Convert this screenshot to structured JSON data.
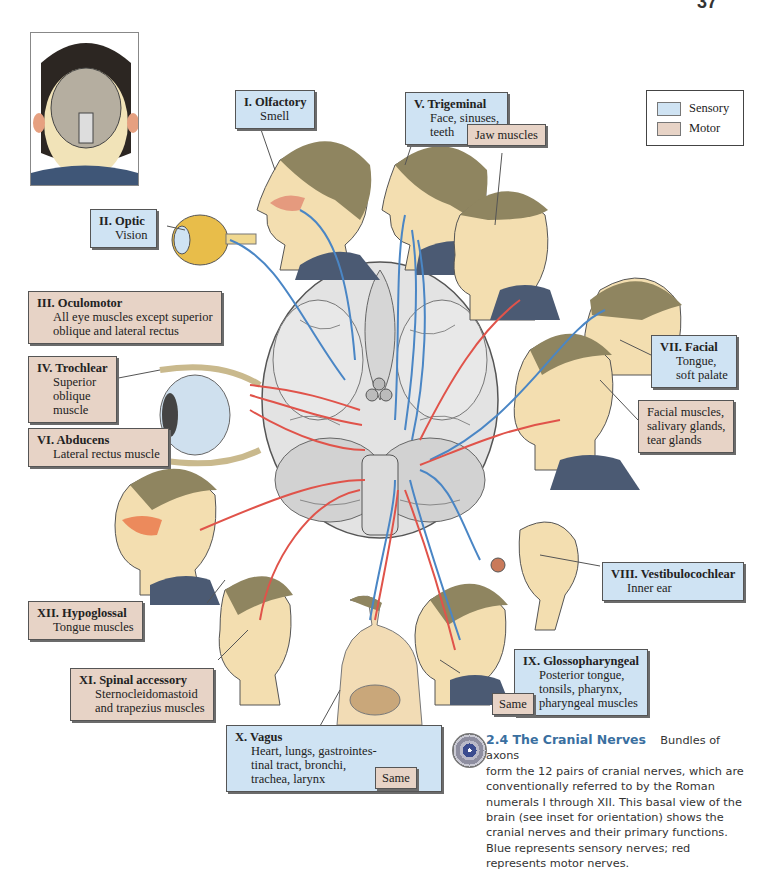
{
  "page": {
    "number": "37"
  },
  "legend": {
    "items": [
      {
        "label": "Sensory",
        "color": "#cfe3f3"
      },
      {
        "label": "Motor",
        "color": "#e7d3c6"
      }
    ]
  },
  "colors": {
    "sensory_nerve": "#4a86c5",
    "motor_nerve": "#e0534a",
    "sensory_box": "#cfe3f3",
    "motor_box": "#e7d3c6",
    "caption_title": "#3a6fa0"
  },
  "inset": {
    "description": "Basal view of brain inside inverted head (orientation inset)"
  },
  "nerves": [
    {
      "id": "I",
      "title": "I. Olfactory",
      "function": "Smell",
      "type": "sensory"
    },
    {
      "id": "II",
      "title": "II. Optic",
      "function": "Vision",
      "type": "sensory"
    },
    {
      "id": "III",
      "title": "III. Oculomotor",
      "function_lines": [
        "All eye muscles except superior",
        "oblique and lateral rectus"
      ],
      "type": "motor"
    },
    {
      "id": "IV",
      "title": "IV. Trochlear",
      "function_lines": [
        "Superior",
        "oblique",
        "muscle"
      ],
      "type": "motor"
    },
    {
      "id": "V",
      "title": "V. Trigeminal",
      "function_lines": [
        "Face, sinuses,",
        "teeth"
      ],
      "type": "sensory",
      "motor_label": "Jaw muscles"
    },
    {
      "id": "VI",
      "title": "VI. Abducens",
      "function": "Lateral rectus muscle",
      "type": "motor"
    },
    {
      "id": "VII",
      "title": "VII. Facial",
      "function_lines": [
        "Tongue,",
        "soft palate"
      ],
      "type": "sensory",
      "motor_lines": [
        "Facial muscles,",
        "salivary glands,",
        "tear glands"
      ]
    },
    {
      "id": "VIII",
      "title": "VIII. Vestibulocochlear",
      "function": "Inner ear",
      "type": "sensory"
    },
    {
      "id": "IX",
      "title": "IX. Glossopharyngeal",
      "function_lines": [
        "Posterior tongue,",
        "tonsils, pharynx,",
        "pharyngeal muscles"
      ],
      "type": "sensory",
      "motor_label": "Same"
    },
    {
      "id": "X",
      "title": "X. Vagus",
      "function_lines": [
        "Heart, lungs, gastrointes-",
        "tinal tract, bronchi,",
        "trachea, larynx"
      ],
      "type": "sensory",
      "motor_label": "Same"
    },
    {
      "id": "XI",
      "title": "XI. Spinal accessory",
      "function_lines": [
        "Sternocleidomastoid",
        "and trapezius muscles"
      ],
      "type": "motor"
    },
    {
      "id": "XII",
      "title": "XII. Hypoglossal",
      "function": "Tongue muscles",
      "type": "motor"
    }
  ],
  "caption": {
    "title": "2.4  The Cranial Nerves",
    "text_first": "Bundles of axons",
    "text_rest": "form the 12 pairs of cranial nerves, which are conventionally referred to by the Roman numerals I through XII. This basal view of the brain (see inset for orientation) shows the cranial nerves and their primary functions. Blue represents sensory nerves; red represents motor nerves."
  }
}
